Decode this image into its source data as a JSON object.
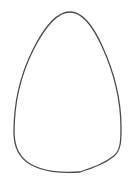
{
  "figure": {
    "shape": "egg-outline",
    "stroke_color": "#4a4a4a",
    "fill_color": "#ffffff",
    "stroke_width": 1.3
  }
}
